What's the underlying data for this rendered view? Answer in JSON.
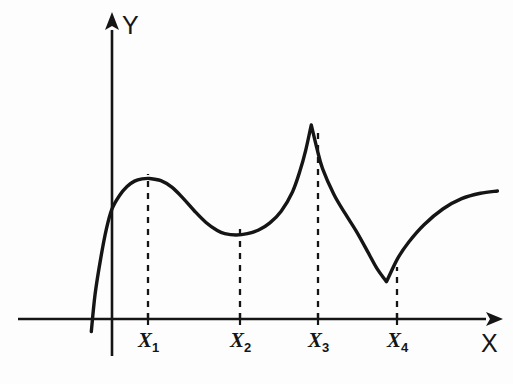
{
  "figure": {
    "background_color": "#fdfdfd",
    "ink_color": "#151515",
    "axes": {
      "x_label": "X",
      "y_label": "Y",
      "x_axis_name": "x-axis",
      "y_axis_name": "y-axis",
      "arrowheads": true,
      "grid": false
    },
    "tick_labels": [
      {
        "base": "X",
        "sub": "1"
      },
      {
        "base": "X",
        "sub": "2"
      },
      {
        "base": "X",
        "sub": "3"
      },
      {
        "base": "X",
        "sub": "4"
      }
    ]
  },
  "chart_data": {
    "type": "line",
    "title": "",
    "subtitle": "",
    "xlabel": "X",
    "ylabel": "Y",
    "grid": false,
    "legend": null,
    "xlim": [
      -1.0,
      10.4
    ],
    "ylim": [
      -0.35,
      5.2
    ],
    "x_ticks": [
      "X1",
      "X2",
      "X3",
      "X4"
    ],
    "x_tick_values": [
      1.0,
      3.3,
      5.3,
      7.3
    ],
    "y_ticks": [],
    "annotations": [
      {
        "name": "local-maximum",
        "at": "X1",
        "x": 1.0,
        "y": 3.13,
        "note": "smooth local maximum, derivative zero"
      },
      {
        "name": "local-minimum",
        "at": "X2",
        "x": 3.3,
        "y": 1.87,
        "note": "smooth local minimum, derivative zero"
      },
      {
        "name": "cusp-maximum",
        "at": "X3",
        "x": 5.3,
        "y": 4.32,
        "note": "sharp cusp, derivative undefined"
      },
      {
        "name": "corner-minimum",
        "at": "X4",
        "x": 7.3,
        "y": 0.83,
        "note": "corner point, derivative undefined"
      }
    ],
    "dashed_drop_lines": [
      {
        "x": 1.0,
        "y_top": 3.13
      },
      {
        "x": 3.3,
        "y_top": 1.87
      },
      {
        "x": 5.3,
        "y_top": 4.32
      },
      {
        "x": 7.3,
        "y_top": 0.83
      }
    ],
    "series": [
      {
        "name": "f(x)",
        "x": [
          -0.55,
          -0.45,
          -0.3,
          -0.15,
          0.0,
          0.2,
          0.4,
          0.6,
          0.8,
          1.0,
          1.3,
          1.6,
          1.9,
          2.2,
          2.5,
          2.8,
          3.0,
          3.3,
          3.6,
          3.9,
          4.2,
          4.5,
          4.8,
          5.0,
          5.15,
          5.3,
          5.45,
          5.6,
          5.9,
          6.2,
          6.5,
          6.8,
          7.05,
          7.3,
          7.6,
          7.9,
          8.3,
          8.8,
          9.3,
          9.8,
          10.25
        ],
        "y": [
          -0.28,
          0.55,
          1.35,
          2.0,
          2.45,
          2.75,
          2.95,
          3.07,
          3.12,
          3.13,
          3.08,
          2.93,
          2.68,
          2.4,
          2.15,
          1.97,
          1.9,
          1.87,
          1.9,
          1.98,
          2.14,
          2.4,
          2.83,
          3.3,
          3.75,
          4.32,
          3.8,
          3.35,
          2.78,
          2.35,
          1.95,
          1.5,
          1.12,
          0.83,
          1.35,
          1.72,
          2.1,
          2.45,
          2.68,
          2.8,
          2.85
        ]
      }
    ]
  }
}
